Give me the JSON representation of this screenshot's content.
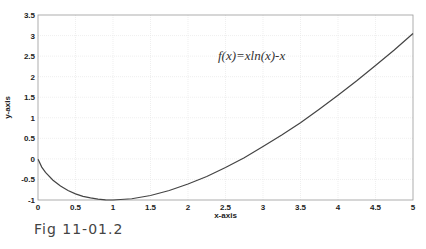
{
  "chart_data": {
    "type": "line",
    "title": "",
    "xlabel": "x-axis",
    "ylabel": "y-axis",
    "xlim": [
      0,
      5
    ],
    "ylim": [
      -1,
      3.5
    ],
    "grid": true,
    "xticks": [
      0,
      0.5,
      1,
      1.5,
      2,
      2.5,
      3,
      3.5,
      4,
      4.5,
      5
    ],
    "xtick_labels": [
      "0",
      "0.5",
      "1",
      "1.5",
      "2",
      "2.5",
      "3",
      "3.5",
      "4",
      "4.5",
      "5"
    ],
    "yticks": [
      -1,
      -0.5,
      0,
      0.5,
      1,
      1.5,
      2,
      2.5,
      3,
      3.5
    ],
    "ytick_labels": [
      "-1",
      "-0.5",
      "0",
      "0.5",
      "1",
      "1.5",
      "2",
      "2.5",
      "3",
      "3.5"
    ],
    "annotation": {
      "text": "f(x)=xln(x)-x",
      "x": 2.4,
      "y": 2.4
    },
    "series": [
      {
        "name": "f(x)=xln(x)-x",
        "color": "#444444",
        "x": [
          0.001,
          0.05,
          0.1,
          0.2,
          0.3,
          0.4,
          0.5,
          0.6,
          0.7,
          0.8,
          0.9,
          1.0,
          1.25,
          1.5,
          1.75,
          2.0,
          2.25,
          2.5,
          2.75,
          3.0,
          3.25,
          3.5,
          3.75,
          4.0,
          4.25,
          4.5,
          4.75,
          5.0
        ],
        "y": [
          -0.008,
          -0.2,
          -0.33,
          -0.52,
          -0.66,
          -0.77,
          -0.85,
          -0.91,
          -0.95,
          -0.98,
          -0.995,
          -1.0,
          -0.97,
          -0.89,
          -0.77,
          -0.61,
          -0.43,
          -0.21,
          0.03,
          0.3,
          0.58,
          0.88,
          1.21,
          1.55,
          1.9,
          2.27,
          2.65,
          3.05
        ]
      }
    ]
  },
  "caption": "Fig 11-01.2"
}
